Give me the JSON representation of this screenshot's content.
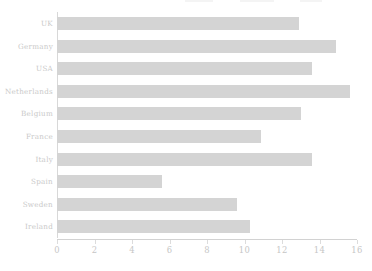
{
  "chart_data": {
    "type": "bar",
    "orientation": "horizontal",
    "title": "",
    "xlabel": "",
    "ylabel": "",
    "categories": [
      "UK",
      "Germany",
      "USA",
      "Netherlands",
      "Belgium",
      "France",
      "Italy",
      "Spain",
      "Sweden",
      "Ireland"
    ],
    "values": [
      12.9,
      14.9,
      13.6,
      15.6,
      13.0,
      10.9,
      13.6,
      5.6,
      9.6,
      10.3
    ],
    "xlim": [
      0,
      16
    ],
    "xticks": [
      0,
      2,
      4,
      6,
      8,
      10,
      12,
      14,
      16
    ],
    "xtick_labels": [
      "0",
      "2",
      "4",
      "6",
      "8",
      "10",
      "12",
      "14",
      "16"
    ],
    "grid": false,
    "legend": false,
    "bar_color": "#d4d4d4",
    "text_color": "#c9c9c9",
    "axis_color": "#d8d8d8",
    "background": "#ffffff"
  }
}
